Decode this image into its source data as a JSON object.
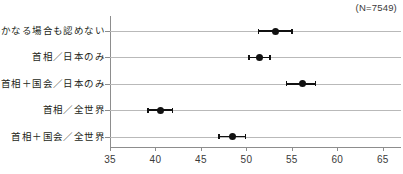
{
  "chart_data": {
    "type": "scatter",
    "orientation": "horizontal",
    "title": "",
    "subtitle": "",
    "xlabel": "",
    "ylabel": "",
    "annotation": "(N=7549)",
    "sample_size": 7549,
    "xlim": [
      35,
      67
    ],
    "xticks": [
      35,
      40,
      45,
      50,
      55,
      60,
      65
    ],
    "xtick_labels": [
      "35",
      "40",
      "45",
      "50",
      "55",
      "60",
      "65"
    ],
    "grid": "horizontal",
    "legend": "none",
    "marker_color": "#111111",
    "gridline_color": "#b9b9b9",
    "axis_color": "#8d8d8d",
    "categories": [
      "いかなる場合も認めない",
      "首相／日本のみ",
      "首相＋国会／日本のみ",
      "首相／全世界",
      "首相＋国会／全世界"
    ],
    "values": [
      53.2,
      51.4,
      56.2,
      40.6,
      48.5
    ],
    "error_low": [
      51.3,
      50.3,
      54.4,
      39.2,
      47.0
    ],
    "error_high": [
      55.0,
      52.6,
      57.6,
      41.9,
      49.9
    ],
    "points": [
      {
        "label": "いかなる場合も認めない",
        "value": 53.2,
        "low": 51.3,
        "high": 55.0
      },
      {
        "label": "首相／日本のみ",
        "value": 51.4,
        "low": 50.3,
        "high": 52.6
      },
      {
        "label": "首相＋国会／日本のみ",
        "value": 56.2,
        "low": 54.4,
        "high": 57.6
      },
      {
        "label": "首相／全世界",
        "value": 40.6,
        "low": 39.2,
        "high": 41.9
      },
      {
        "label": "首相＋国会／全世界",
        "value": 48.5,
        "low": 47.0,
        "high": 49.9
      }
    ]
  }
}
